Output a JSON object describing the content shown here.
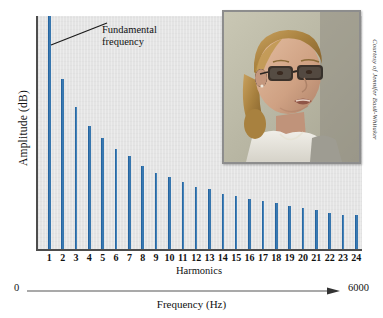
{
  "figure": {
    "background_color": "#ffffff",
    "plot_background_color": "#e4e4e4",
    "bar_color": "#2d6ea9",
    "axis_color": "#4d4d4d"
  },
  "annotation": {
    "line1": "Fundamental",
    "line2": "frequency",
    "points_to_harmonic": 1
  },
  "axes": {
    "ylabel": "Amplitude (dB)",
    "harmonics_label": "Harmonics",
    "frequency_label": "Frequency (Hz)",
    "frequency_min": "0",
    "frequency_max": "6000"
  },
  "photo": {
    "alt": "Woman with glasses speaking",
    "credit": "Courtesy of Jennifer Basil-Whitaker"
  },
  "chart_data": {
    "type": "bar",
    "title": "",
    "subtitle": "",
    "xlabel": "Harmonics",
    "ylabel": "Amplitude (dB)",
    "secondary_xlabel": "Frequency (Hz)",
    "secondary_xlim": [
      0,
      6000
    ],
    "grid": false,
    "legend": "none",
    "categories": [
      "1",
      "2",
      "3",
      "4",
      "5",
      "6",
      "7",
      "8",
      "9",
      "10",
      "11",
      "12",
      "13",
      "14",
      "15",
      "16",
      "17",
      "18",
      "19",
      "20",
      "21",
      "22",
      "23",
      "24"
    ],
    "values": [
      100,
      73,
      61,
      53,
      48,
      43,
      40,
      36,
      33,
      31,
      29,
      27,
      26,
      24,
      23,
      22,
      21,
      20,
      19,
      18,
      17,
      16,
      15,
      15
    ],
    "ylim": [
      0,
      100
    ],
    "annotations": [
      {
        "text": "Fundamental frequency",
        "target_category": "1"
      }
    ]
  }
}
